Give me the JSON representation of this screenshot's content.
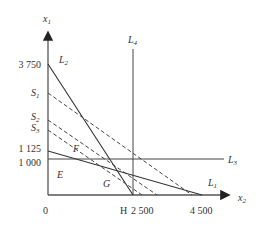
{
  "axes": {
    "y_label": "x",
    "y_label_sub": "1",
    "x_label": "x",
    "x_label_sub": "2",
    "origin": "0"
  },
  "y_ticks": {
    "t3750": "3 750",
    "t1125": "1 125",
    "t1000": "1 000"
  },
  "x_ticks": {
    "h": "H",
    "t2500": "2 500",
    "t4500": "4 500"
  },
  "lines": {
    "L1": {
      "name": "L",
      "sub": "1",
      "from": [
        0,
        1125
      ],
      "to": [
        4500,
        0
      ]
    },
    "L2": {
      "name": "L",
      "sub": "2",
      "from": [
        0,
        3750
      ],
      "to": [
        2500,
        0
      ]
    },
    "L3": {
      "name": "L",
      "sub": "3",
      "x1_value": 1000
    },
    "L4": {
      "name": "L",
      "sub": "4",
      "x2_value": 2500
    }
  },
  "iso_lines": {
    "S1": {
      "name": "S",
      "sub": "1"
    },
    "S2": {
      "name": "S",
      "sub": "2"
    },
    "S3": {
      "name": "S",
      "sub": "3"
    }
  },
  "regions": {
    "E": "E",
    "F": "F",
    "G": "G"
  },
  "colors": {
    "line": "#333333",
    "axis": "#555555"
  }
}
